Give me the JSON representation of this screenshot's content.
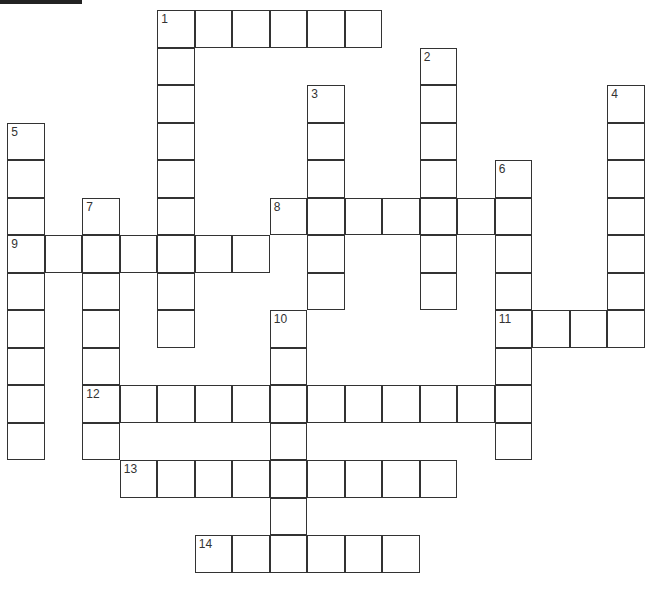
{
  "puzzle": {
    "type": "crossword",
    "cell_size": 37.5,
    "origin": {
      "x": 8,
      "y": 11
    },
    "words": [
      {
        "number": "1",
        "direction": "across",
        "row": 0,
        "col": 4,
        "length": 6
      },
      {
        "number": "1",
        "direction": "down",
        "row": 0,
        "col": 4,
        "length": 9
      },
      {
        "number": "2",
        "direction": "down",
        "row": 1,
        "col": 11,
        "length": 7
      },
      {
        "number": "3",
        "direction": "down",
        "row": 2,
        "col": 8,
        "length": 6
      },
      {
        "number": "4",
        "direction": "down",
        "row": 2,
        "col": 16,
        "length": 7
      },
      {
        "number": "5",
        "direction": "down",
        "row": 3,
        "col": 0,
        "length": 9
      },
      {
        "number": "6",
        "direction": "down",
        "row": 4,
        "col": 13,
        "length": 8
      },
      {
        "number": "7",
        "direction": "down",
        "row": 5,
        "col": 2,
        "length": 7
      },
      {
        "number": "8",
        "direction": "across",
        "row": 5,
        "col": 7,
        "length": 7
      },
      {
        "number": "9",
        "direction": "across",
        "row": 6,
        "col": 0,
        "length": 7
      },
      {
        "number": "10",
        "direction": "down",
        "row": 8,
        "col": 7,
        "length": 7
      },
      {
        "number": "11",
        "direction": "across",
        "row": 8,
        "col": 13,
        "length": 4
      },
      {
        "number": "12",
        "direction": "across",
        "row": 10,
        "col": 2,
        "length": 12
      },
      {
        "number": "13",
        "direction": "across",
        "row": 12,
        "col": 3,
        "length": 9
      },
      {
        "number": "14",
        "direction": "across",
        "row": 14,
        "col": 5,
        "length": 6
      }
    ]
  }
}
